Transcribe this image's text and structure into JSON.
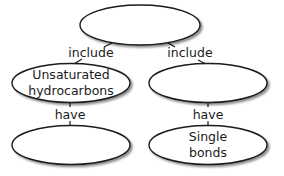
{
  "diagram": {
    "type": "concept-map",
    "colors": {
      "stroke": "#1a1a1a",
      "fill": "#ffffff",
      "shadow": "#b0b0b0",
      "text": "#1a1a1a"
    },
    "nodes": [
      {
        "id": "top",
        "lines": []
      },
      {
        "id": "mid-left",
        "lines": [
          "Unsaturated",
          "hydrocarbons"
        ]
      },
      {
        "id": "mid-right",
        "lines": []
      },
      {
        "id": "bottom-left",
        "lines": []
      },
      {
        "id": "bottom-right",
        "lines": [
          "Single",
          "bonds"
        ]
      }
    ],
    "edges": [
      {
        "from": "top",
        "to": "mid-left",
        "label": "include"
      },
      {
        "from": "top",
        "to": "mid-right",
        "label": "include"
      },
      {
        "from": "mid-left",
        "to": "bottom-left",
        "label": "have"
      },
      {
        "from": "mid-right",
        "to": "bottom-right",
        "label": "have"
      }
    ]
  }
}
